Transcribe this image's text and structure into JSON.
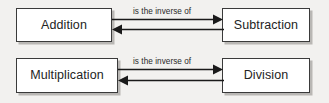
{
  "diagram": {
    "background_color": "#f2f1ef",
    "box_fill_color": "#ffffff",
    "box_border_color": "#3a3a3a",
    "shadow_color": "#b9b7b4",
    "arrow_color": "#1a1a1a",
    "text_color": "#232323",
    "rows": [
      {
        "left_node": "Addition",
        "right_node": "Subtraction",
        "edge_label": "is the inverse of",
        "arrow_forward": "right",
        "arrow_backward": "left"
      },
      {
        "left_node": "Multiplication",
        "right_node": "Division",
        "edge_label": "is the inverse of",
        "arrow_forward": "right",
        "arrow_backward": "left"
      }
    ]
  }
}
